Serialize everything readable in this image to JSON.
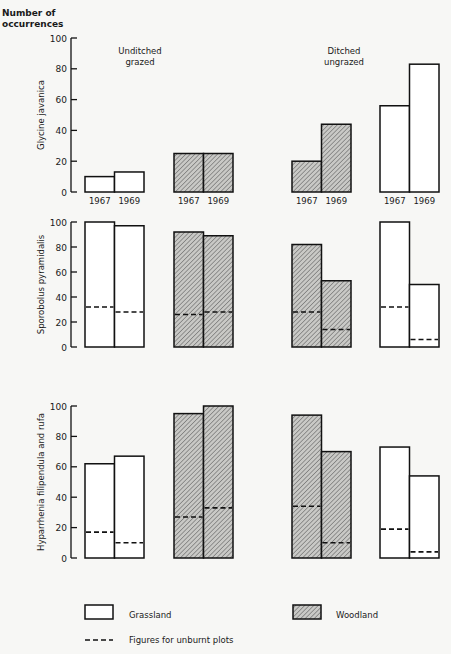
{
  "chart_data": {
    "type": "bar",
    "title": "",
    "ylabel_header": [
      "Number of",
      "occurrences"
    ],
    "categories": [
      "1967",
      "1969"
    ],
    "group_labels": [
      {
        "text": [
          "Unditched",
          "grazed"
        ],
        "group": "unditched"
      },
      {
        "text": [
          "Ditched",
          "ungrazed"
        ],
        "group": "ditched"
      }
    ],
    "yticks": [
      0,
      20,
      40,
      60,
      80,
      100
    ],
    "ylim": [
      0,
      100
    ],
    "groups": [
      {
        "treatment": "Unditched grazed",
        "habitat": "Grassland"
      },
      {
        "treatment": "Unditched grazed",
        "habitat": "Woodland"
      },
      {
        "treatment": "Ditched ungrazed",
        "habitat": "Woodland"
      },
      {
        "treatment": "Ditched ungrazed",
        "habitat": "Grassland"
      }
    ],
    "panels": [
      {
        "species": "Glycine javanica",
        "show_year_labels": true,
        "values": [
          [
            10,
            13
          ],
          [
            25,
            25
          ],
          [
            20,
            44
          ],
          [
            56,
            83
          ]
        ],
        "unburnt": [
          null,
          null,
          null,
          null
        ]
      },
      {
        "species": "Sporobolus pyramidalis",
        "show_year_labels": false,
        "values": [
          [
            100,
            97
          ],
          [
            92,
            89
          ],
          [
            82,
            53
          ],
          [
            100,
            50
          ]
        ],
        "unburnt": [
          [
            32,
            28
          ],
          [
            26,
            28
          ],
          [
            28,
            14
          ],
          [
            32,
            6
          ]
        ]
      },
      {
        "species": "Hyparrhenia filipendula and rufa",
        "show_year_labels": false,
        "values": [
          [
            62,
            67
          ],
          [
            95,
            100
          ],
          [
            94,
            70
          ],
          [
            73,
            54
          ]
        ],
        "unburnt": [
          [
            17,
            10
          ],
          [
            27,
            33
          ],
          [
            34,
            10
          ],
          [
            19,
            4
          ]
        ]
      }
    ],
    "legend": {
      "grassland": "Grassland",
      "woodland": "Woodland",
      "unburnt": "Figures for unburnt plots"
    },
    "grid": false,
    "legend_position": "bottom"
  }
}
